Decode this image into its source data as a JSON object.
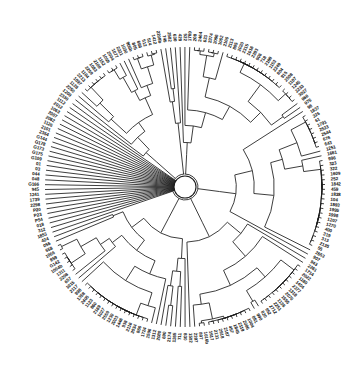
{
  "figure": {
    "kind": "circular-phylogenetic-tree",
    "title": "",
    "background_color": "#ffffff",
    "line_color": "#1b1b1b",
    "label_color": "#111111"
  },
  "chart_data": {
    "type": "tree",
    "layout": "circular-dendrogram",
    "title": "",
    "xlabel": "",
    "ylabel": "",
    "grid": false,
    "legend": null,
    "center": {
      "x": 185,
      "y": 187
    },
    "root_node_radius": 11,
    "leaf_radius": 140,
    "label_radius": 146,
    "leaf_count": 205,
    "angle_start_deg": -93,
    "angle_sweep_deg": 360,
    "leaves": [
      "429",
      "522",
      "1769",
      "208",
      "2464",
      "623",
      "2374",
      "2096",
      "1062",
      "2106",
      "2113",
      "885",
      "2020",
      "2315",
      "1016",
      "2283",
      "906",
      "718",
      "2188",
      "1153",
      "2249",
      "804",
      "915",
      "2508",
      "1107",
      "1245",
      "2233",
      "3027",
      "966",
      "975",
      "98",
      "1837",
      "326",
      "61",
      "1791",
      "2523",
      "2544",
      "676",
      "643",
      "1251",
      "1661",
      "996",
      "323",
      "322",
      "1609",
      "252",
      "1842",
      "459",
      "1838",
      "104",
      "1893",
      "1995",
      "1998",
      "1207",
      "1270",
      "400",
      "319",
      "313",
      "2135",
      "55",
      "2653",
      "907",
      "943",
      "2261",
      "1714",
      "2022",
      "1180",
      "1404",
      "2377",
      "1318",
      "2070",
      "1555",
      "1136",
      "2251",
      "2712",
      "952",
      "820",
      "990",
      "861",
      "1004",
      "2086",
      "2119",
      "1849",
      "457",
      "2187",
      "2918",
      "2131",
      "1617",
      "1016b",
      "807",
      "2207",
      "1502",
      "830",
      "711",
      "1265",
      "2174",
      "690",
      "2080",
      "1312",
      "1506",
      "1724",
      "866",
      "2034",
      "2116",
      "938",
      "1446",
      "2003",
      "1230",
      "2550",
      "1027",
      "2169",
      "860",
      "1123",
      "2405",
      "1358",
      "998",
      "2117",
      "1015",
      "657",
      "2208",
      "1311",
      "1004b",
      "G142",
      "859",
      "1066",
      "658",
      "056",
      "424",
      "1853",
      "312",
      "018",
      "P54",
      "P23",
      "P20",
      "2298",
      "1739",
      "1241",
      "945",
      "G166",
      "048",
      "044",
      "03",
      "01",
      "G109",
      "G175",
      "G173",
      "G178",
      "G144",
      "2354",
      "2101",
      "1126",
      "2062",
      "2007",
      "1063",
      "2012",
      "1112",
      "2330",
      "1209",
      "2250",
      "1128",
      "1097",
      "2213",
      "1104",
      "2259",
      "1083",
      "2108",
      "1152",
      "1059",
      "2004",
      "1077",
      "2221",
      "1030",
      "906b",
      "805",
      "666",
      "512",
      "514",
      "1412",
      "2208b",
      "745",
      "2582",
      "630"
    ],
    "label_prefix_groups": [
      {
        "prefix": "P",
        "members": [
          "P20",
          "P23",
          "P54"
        ]
      },
      {
        "prefix": "G",
        "members": [
          "G144",
          "G178",
          "G173",
          "G175",
          "G109",
          "G166",
          "G142"
        ]
      }
    ]
  }
}
